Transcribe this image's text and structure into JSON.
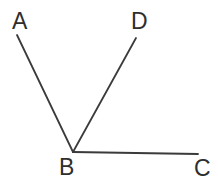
{
  "figure": {
    "type": "geometry-line-diagram",
    "canvas": {
      "width": 218,
      "height": 183,
      "background": "#ffffff"
    },
    "style": {
      "line_color": "#3b3b3b",
      "line_width": 1.8,
      "label_color": "#2e2e2e",
      "label_font_size": 23
    },
    "points": {
      "A": {
        "x": 17,
        "y": 35,
        "label": "A",
        "label_x": 12,
        "label_y": 10
      },
      "B": {
        "x": 73,
        "y": 152,
        "label": "B",
        "label_x": 59,
        "label_y": 156
      },
      "C": {
        "x": 198,
        "y": 154,
        "label": "C",
        "label_x": 194,
        "label_y": 157
      },
      "D": {
        "x": 136,
        "y": 38,
        "label": "D",
        "label_x": 131,
        "label_y": 10
      }
    },
    "segments": [
      {
        "name": "segment-BA",
        "from": "B",
        "to": "A",
        "path": "M 73 152 L 17 35"
      },
      {
        "name": "segment-BD",
        "from": "B",
        "to": "D",
        "path": "M 73 152 L 136 38"
      },
      {
        "name": "segment-BC",
        "from": "B",
        "to": "C",
        "path": "M 73 152 L 198 154"
      }
    ]
  }
}
